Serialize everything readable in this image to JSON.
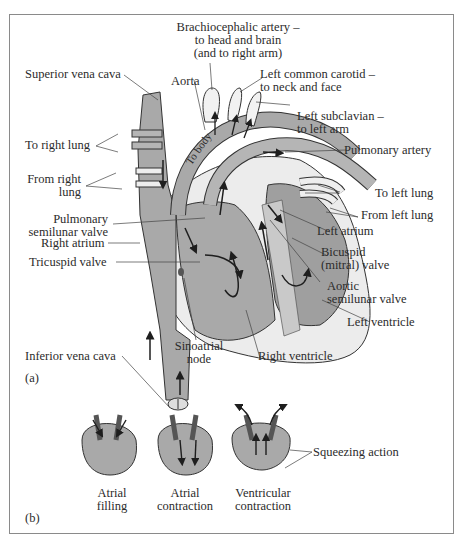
{
  "figure": {
    "panel_a": {
      "tag": "(a)",
      "labels": {
        "brachiocephalic_1": "Brachiocephalic artery –",
        "brachiocephalic_2": "to head and brain",
        "brachiocephalic_3": "(and to right arm)",
        "superior_vena_cava": "Superior vena cava",
        "aorta": "Aorta",
        "left_common_carotid_1": "Left common carotid –",
        "left_common_carotid_2": "to neck and face",
        "left_subclavian_1": "Left subclavian –",
        "left_subclavian_2": "to left arm",
        "to_right_lung": "To right lung",
        "from_right_lung_1": "From right",
        "from_right_lung_2": "lung",
        "pulmonary_artery": "Pulmonary artery",
        "to_left_lung": "To left lung",
        "from_left_lung": "From left lung",
        "pulmonary_semilunar_1": "Pulmonary",
        "pulmonary_semilunar_2": "semilunar valve",
        "left_atrium": "Left atrium",
        "right_atrium": "Right atrium",
        "bicuspid_1": "Bicuspid",
        "bicuspid_2": "(mitral) valve",
        "tricuspid_valve": "Tricuspid valve",
        "aortic_semilunar_1": "Aortic",
        "aortic_semilunar_2": "semilunar valve",
        "left_ventricle": "Left ventricle",
        "inferior_vena_cava": "Inferior vena cava",
        "sinoatrial_1": "Sinoatrial",
        "sinoatrial_2": "node",
        "right_ventricle": "Right ventricle",
        "to_body": "To body"
      }
    },
    "panel_b": {
      "tag": "(b)",
      "stages": [
        {
          "line1": "Atrial",
          "line2": "filling"
        },
        {
          "line1": "Atrial",
          "line2": "contraction"
        },
        {
          "line1": "Ventricular",
          "line2": "contraction"
        }
      ],
      "squeezing": "Squeezing action"
    },
    "colors": {
      "tissue_gray": "#a9a9a9",
      "outline": "#2a2a2a",
      "light_wall": "#e6e6e6",
      "frame": "#8a8a8a"
    }
  }
}
